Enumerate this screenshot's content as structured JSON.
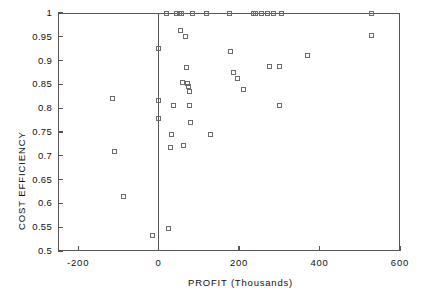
{
  "chart_data": {
    "type": "scatter",
    "title": "",
    "xlabel": "PROFIT (Thousands)",
    "ylabel": "COST EFFICIENCY",
    "xlim": [
      -250,
      600
    ],
    "ylim": [
      0.5,
      1.0
    ],
    "xticks": [
      -200,
      0,
      200,
      400,
      600
    ],
    "xticklabels": [
      "-200",
      "0",
      "200",
      "400",
      "600"
    ],
    "yticks": [
      0.5,
      0.55,
      0.6,
      0.65,
      0.7,
      0.75,
      0.8,
      0.85,
      0.9,
      0.95,
      1.0
    ],
    "yticklabels": [
      "0.5",
      "0.55",
      "0.6",
      "0.65",
      "0.7",
      "0.75",
      "0.8",
      "0.85",
      "0.9",
      "0.95",
      "1"
    ],
    "grid": false,
    "legend": null,
    "marker": "open-square",
    "reference_lines": [
      {
        "orientation": "vertical",
        "x": 0
      }
    ],
    "points": [
      {
        "x": -115,
        "y": 0.82
      },
      {
        "x": -110,
        "y": 0.71
      },
      {
        "x": -88,
        "y": 0.614
      },
      {
        "x": -15,
        "y": 0.532
      },
      {
        "x": 0,
        "y": 0.925
      },
      {
        "x": 0,
        "y": 0.816
      },
      {
        "x": 0,
        "y": 0.779
      },
      {
        "x": 20,
        "y": 1.0
      },
      {
        "x": 25,
        "y": 0.548
      },
      {
        "x": 30,
        "y": 0.718
      },
      {
        "x": 32,
        "y": 0.745
      },
      {
        "x": 38,
        "y": 0.806
      },
      {
        "x": 45,
        "y": 1.0
      },
      {
        "x": 52,
        "y": 1.0
      },
      {
        "x": 58,
        "y": 1.0
      },
      {
        "x": 55,
        "y": 0.963
      },
      {
        "x": 60,
        "y": 0.855
      },
      {
        "x": 62,
        "y": 0.722
      },
      {
        "x": 68,
        "y": 0.95
      },
      {
        "x": 70,
        "y": 0.885
      },
      {
        "x": 72,
        "y": 0.852
      },
      {
        "x": 74,
        "y": 0.845
      },
      {
        "x": 76,
        "y": 0.835
      },
      {
        "x": 78,
        "y": 0.806
      },
      {
        "x": 80,
        "y": 0.77
      },
      {
        "x": 85,
        "y": 1.0
      },
      {
        "x": 120,
        "y": 1.0
      },
      {
        "x": 130,
        "y": 0.745
      },
      {
        "x": 175,
        "y": 1.0
      },
      {
        "x": 178,
        "y": 0.92
      },
      {
        "x": 185,
        "y": 0.875
      },
      {
        "x": 195,
        "y": 0.862
      },
      {
        "x": 210,
        "y": 0.84
      },
      {
        "x": 235,
        "y": 1.0
      },
      {
        "x": 242,
        "y": 1.0
      },
      {
        "x": 255,
        "y": 1.0
      },
      {
        "x": 270,
        "y": 1.0
      },
      {
        "x": 285,
        "y": 1.0
      },
      {
        "x": 275,
        "y": 0.888
      },
      {
        "x": 300,
        "y": 0.888
      },
      {
        "x": 305,
        "y": 1.0
      },
      {
        "x": 300,
        "y": 0.806
      },
      {
        "x": 370,
        "y": 0.91
      },
      {
        "x": 530,
        "y": 1.0
      },
      {
        "x": 528,
        "y": 0.952
      }
    ]
  }
}
